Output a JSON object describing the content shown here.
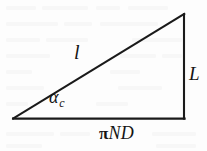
{
  "figure": {
    "type": "right-triangle-diagram",
    "background_color": "#fdfdfd",
    "stroke_color": "#1a1a1a",
    "stroke_width": 2,
    "right_angle_vertex": "bottom-right"
  },
  "geometry": {
    "vertices": {
      "left": {
        "x": 13,
        "y": 119
      },
      "bottom_right": {
        "x": 184,
        "y": 119
      },
      "apex": {
        "x": 184,
        "y": 14
      }
    },
    "sides": {
      "base_length_px": 171,
      "vertical_length_px": 105,
      "hypotenuse_length_px": 201
    }
  },
  "labels": {
    "hypotenuse": "l",
    "angle_base": "α",
    "angle_subscript": "c",
    "vertical": "L",
    "base_pi": "π",
    "base_rest": "ND"
  }
}
